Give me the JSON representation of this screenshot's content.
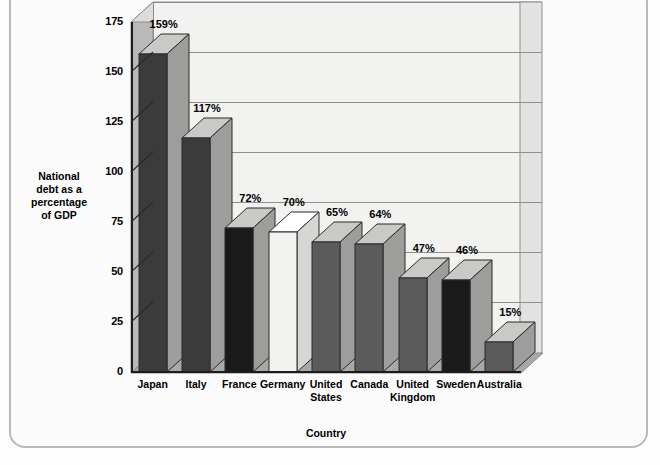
{
  "chart_data": {
    "type": "bar",
    "title": "",
    "xlabel": "Country",
    "ylabel": "National debt as a percentage of GDP",
    "ylabel_lines": [
      "National",
      "debt as a",
      "percentage",
      "of  GDP"
    ],
    "categories": [
      "Japan",
      "Italy",
      "France",
      "Germany",
      "United States",
      "Canada",
      "United Kingdom",
      "Sweden",
      "Australia"
    ],
    "category_lines": [
      [
        "Japan"
      ],
      [
        "Italy"
      ],
      [
        "France"
      ],
      [
        "Germany"
      ],
      [
        "United",
        "States"
      ],
      [
        "Canada"
      ],
      [
        "United",
        "Kingdom"
      ],
      [
        "Sweden"
      ],
      [
        "Australia"
      ]
    ],
    "values": [
      159,
      117,
      72,
      70,
      65,
      64,
      47,
      46,
      15
    ],
    "value_labels": [
      "159%",
      "117%",
      "72%",
      "70%",
      "65%",
      "64%",
      "47%",
      "46%",
      "15%"
    ],
    "bar_colors": [
      "#3b3b3b",
      "#3b3b3b",
      "#1a1a1a",
      "#f2f2f0",
      "#5b5b5b",
      "#5b5b5b",
      "#5b5b5b",
      "#1a1a1a",
      "#5b5b5b"
    ],
    "ylim": [
      0,
      175
    ],
    "yticks": [
      0,
      25,
      50,
      75,
      100,
      125,
      150,
      175
    ],
    "ytick_labels": [
      "0",
      "25",
      "50",
      "75",
      "100",
      "125",
      "150",
      "175"
    ],
    "grid": true,
    "grid_axis": "y",
    "legend": false,
    "style": "3d-bar",
    "colors": {
      "plot_background": "#f2f2f0",
      "wall_shade": "#b9b9b9",
      "axis": "#1c1c1c",
      "gridline": "#8f8f8f",
      "frame_border": "#b9b9b9",
      "page_background": "#fdfdfd",
      "text": "#000000"
    }
  }
}
